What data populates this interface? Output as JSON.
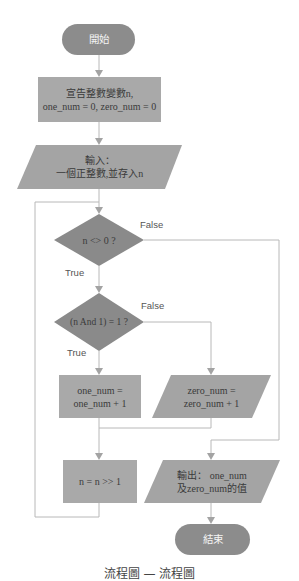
{
  "flowchart": {
    "nodes": {
      "start": {
        "type": "terminator",
        "label": "開始"
      },
      "declare": {
        "type": "process",
        "lines": [
          "宣告整數變數n,",
          "one_num = 0, zero_num = 0"
        ]
      },
      "input": {
        "type": "io",
        "lines": [
          "輸入：",
          "一個正整數,並存入n"
        ]
      },
      "cond_nonzero": {
        "type": "decision",
        "label": "n <> 0 ?"
      },
      "cond_odd": {
        "type": "decision",
        "label": "(n  And 1) = 1 ?"
      },
      "inc_one": {
        "type": "process",
        "lines": [
          "one_num =",
          "one_num + 1"
        ]
      },
      "inc_zero": {
        "type": "io",
        "lines": [
          "zero_num =",
          "zero_num + 1"
        ]
      },
      "shift": {
        "type": "process",
        "label": "n = n >> 1"
      },
      "output": {
        "type": "io",
        "lines": [
          "輸出： one_num",
          "及zero_num的值"
        ]
      },
      "end": {
        "type": "terminator",
        "label": "結束"
      }
    },
    "edge_labels": {
      "nonzero_false": "False",
      "nonzero_true": "True",
      "odd_false": "False",
      "odd_true": "True"
    },
    "colors": {
      "terminator": "#8c8c8c",
      "process": "#a9a9a9",
      "io": "#a4a4a4",
      "decision": "#8a8a8a",
      "connector": "#b4b4b4",
      "arrow": "#9a9a9a"
    }
  },
  "caption": "流程圖 — 流程圖"
}
